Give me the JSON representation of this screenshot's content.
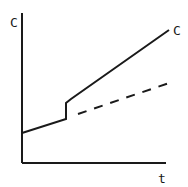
{
  "chart_data": {
    "type": "line",
    "title": "",
    "xlabel": "t",
    "ylabel": "C",
    "grid": false,
    "legend": null,
    "series": [
      {
        "name": "C",
        "style": "solid",
        "label": "C",
        "points_px": [
          [
            22,
            133
          ],
          [
            66,
            119
          ],
          [
            66,
            103
          ],
          [
            71,
            99
          ],
          [
            169,
            30
          ]
        ]
      },
      {
        "name": "baseline",
        "style": "dashed",
        "points_px": [
          [
            78,
            114
          ],
          [
            172,
            82
          ]
        ]
      }
    ]
  },
  "labels": {
    "y_axis": "C",
    "x_axis": "t",
    "curve": "C"
  },
  "colors": {
    "ink": "#1a1a1a",
    "background": "#ffffff"
  }
}
